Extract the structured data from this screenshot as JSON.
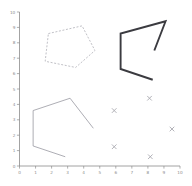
{
  "chart_data": {
    "type": "line",
    "title": "",
    "xlabel": "",
    "ylabel": "",
    "xlim": [
      0,
      10
    ],
    "ylim": [
      0,
      10
    ],
    "grid": false,
    "legend": "none",
    "x_ticks": [
      0,
      1,
      2,
      3,
      4,
      5,
      6,
      7,
      8,
      9,
      10
    ],
    "y_ticks": [
      0,
      1,
      2,
      3,
      4,
      5,
      6,
      7,
      8,
      9,
      10
    ],
    "x_tick_labels": [
      "0",
      "1",
      "2",
      "3",
      "4",
      "5",
      "6",
      "7",
      "8",
      "9",
      "10"
    ],
    "y_tick_labels": [
      "0",
      "1",
      "2",
      "3",
      "4",
      "5",
      "6",
      "7",
      "8",
      "9",
      "10"
    ],
    "series": [
      {
        "name": "dashed-pentagon",
        "type": "line",
        "style": "dashed",
        "closed": true,
        "color": "#b9b9bf",
        "linewidth": 0.9,
        "points": [
          [
            1.8,
            8.6
          ],
          [
            3.9,
            9.1
          ],
          [
            4.7,
            7.5
          ],
          [
            3.5,
            6.4
          ],
          [
            1.6,
            6.8
          ]
        ]
      },
      {
        "name": "thick-open-polyline",
        "type": "line",
        "style": "solid",
        "closed": false,
        "color": "#3b3b40",
        "linewidth": 1.9,
        "points": [
          [
            8.4,
            7.5
          ],
          [
            9.1,
            9.4
          ],
          [
            6.3,
            8.6
          ],
          [
            6.3,
            6.3
          ],
          [
            8.3,
            5.6
          ]
        ]
      },
      {
        "name": "thin-open-polyline",
        "type": "line",
        "style": "solid",
        "closed": false,
        "color": "#9e9ea6",
        "linewidth": 0.85,
        "points": [
          [
            4.6,
            2.45
          ],
          [
            3.15,
            4.4
          ],
          [
            0.85,
            3.6
          ],
          [
            0.85,
            1.3
          ],
          [
            2.85,
            0.6
          ]
        ]
      },
      {
        "name": "x-markers",
        "type": "scatter",
        "marker": "x",
        "color": "#a9a9b0",
        "points": [
          [
            5.9,
            3.6
          ],
          [
            8.1,
            4.4
          ],
          [
            9.5,
            2.4
          ],
          [
            5.9,
            1.25
          ],
          [
            8.15,
            0.6
          ]
        ]
      }
    ]
  },
  "axes": {
    "x_axis_name": "x-axis",
    "y_axis_name": "y-axis"
  }
}
